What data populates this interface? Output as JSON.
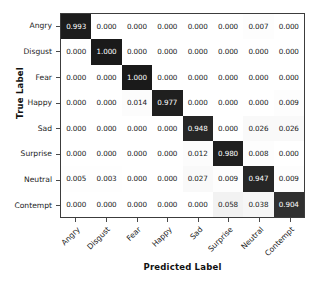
{
  "chart_data": {
    "type": "heatmap",
    "title": "",
    "xlabel": "Predicted Label",
    "ylabel": "True Label",
    "categories": [
      "Angry",
      "Disgust",
      "Fear",
      "Happy",
      "Sad",
      "Surprise",
      "Neutral",
      "Contempt"
    ],
    "x_tick_labels": [
      "Angry",
      "Disgust",
      "Fear",
      "Happy",
      "Sad",
      "Surprise",
      "Neutral",
      "Contempt"
    ],
    "y_tick_labels": [
      "Angry",
      "Disgust",
      "Fear",
      "Happy",
      "Sad",
      "Surprise",
      "Neutral",
      "Contempt"
    ],
    "colormap": "greys",
    "zlim": [
      0,
      1
    ],
    "grid": false,
    "legend": "none",
    "colorbar": false,
    "rows": [
      {
        "label": "Angry",
        "values": [
          0.993,
          0.0,
          0.0,
          0.0,
          0.0,
          0.0,
          0.007,
          0.0
        ],
        "cells": [
          "0.993",
          "0.000",
          "0.000",
          "0.000",
          "0.000",
          "0.000",
          "0.007",
          "0.000"
        ]
      },
      {
        "label": "Disgust",
        "values": [
          0.0,
          1.0,
          0.0,
          0.0,
          0.0,
          0.0,
          0.0,
          0.0
        ],
        "cells": [
          "0.000",
          "1.000",
          "0.000",
          "0.000",
          "0.000",
          "0.000",
          "0.000",
          "0.000"
        ]
      },
      {
        "label": "Fear",
        "values": [
          0.0,
          0.0,
          1.0,
          0.0,
          0.0,
          0.0,
          0.0,
          0.0
        ],
        "cells": [
          "0.000",
          "0.000",
          "1.000",
          "0.000",
          "0.000",
          "0.000",
          "0.000",
          "0.000"
        ]
      },
      {
        "label": "Happy",
        "values": [
          0.0,
          0.0,
          0.014,
          0.977,
          0.0,
          0.0,
          0.0,
          0.009
        ],
        "cells": [
          "0.000",
          "0.000",
          "0.014",
          "0.977",
          "0.000",
          "0.000",
          "0.000",
          "0.009"
        ]
      },
      {
        "label": "Sad",
        "values": [
          0.0,
          0.0,
          0.0,
          0.0,
          0.948,
          0.0,
          0.026,
          0.026
        ],
        "cells": [
          "0.000",
          "0.000",
          "0.000",
          "0.000",
          "0.948",
          "0.000",
          "0.026",
          "0.026"
        ]
      },
      {
        "label": "Surprise",
        "values": [
          0.0,
          0.0,
          0.0,
          0.0,
          0.012,
          0.98,
          0.008,
          0.0
        ],
        "cells": [
          "0.000",
          "0.000",
          "0.000",
          "0.000",
          "0.012",
          "0.980",
          "0.008",
          "0.000"
        ]
      },
      {
        "label": "Neutral",
        "values": [
          0.005,
          0.003,
          0.0,
          0.0,
          0.027,
          0.009,
          0.947,
          0.009
        ],
        "cells": [
          "0.005",
          "0.003",
          "0.000",
          "0.000",
          "0.027",
          "0.009",
          "0.947",
          "0.009"
        ]
      },
      {
        "label": "Contempt",
        "values": [
          0.0,
          0.0,
          0.0,
          0.0,
          0.0,
          0.058,
          0.038,
          0.904
        ],
        "cells": [
          "0.000",
          "0.000",
          "0.000",
          "0.000",
          "0.000",
          "0.058",
          "0.038",
          "0.904"
        ]
      }
    ]
  },
  "axes": {
    "x_title": "Predicted Label",
    "y_title": "True Label"
  },
  "colors": {
    "cell_max": "#1a1a1a",
    "cell_min": "#ffffff",
    "text_dark_cell": "#ffffff",
    "text_light_cell": "#1a1a1a",
    "axis_line": "#3c3c3c",
    "background": "#ffffff"
  }
}
